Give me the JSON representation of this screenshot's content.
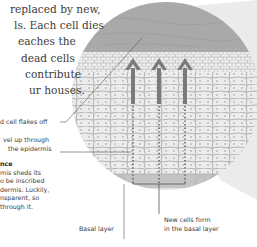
{
  "body_text": {
    "lines": [
      "replaced by new,",
      "ls. Each cell dies",
      "eaches the",
      "dead cells",
      "contribute",
      "ur houses."
    ]
  },
  "labels": {
    "flakes_off": "d cell flakes off",
    "travel_line1": "vel up through",
    "travel_line2": "the epidermis",
    "basal_layer": "Basal layer",
    "new_cells_line1": "New cells form",
    "new_cells_line2": "in the basal layer"
  },
  "sidebar": {
    "heading": "nce",
    "lines": [
      "mis sheds its",
      "o be inscribed",
      "dermis. Luckily,",
      "nsparent, so",
      "through it."
    ]
  },
  "diagram": {
    "arrows": 3,
    "colors": {
      "dead_layer": "#a8a8a8",
      "cells": "#ececec",
      "cell_border": "#9a9a9a",
      "basal_layer": "#c4c4c4",
      "arrow": "#7a7a7a",
      "magnifier_cone": "#e6e6e6",
      "circle_bg": "#dcdcdc"
    }
  }
}
